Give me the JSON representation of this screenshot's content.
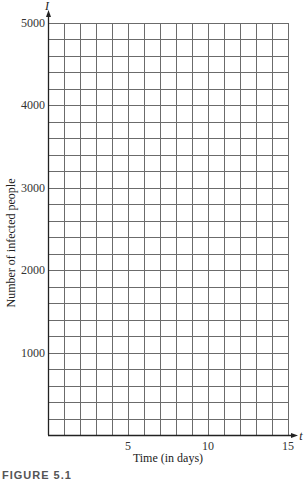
{
  "chart_data": {
    "type": "line",
    "title": "",
    "xlabel": "Time (in days)",
    "ylabel": "Number of infected people",
    "x_axis_variable": "t",
    "y_axis_variable": "I",
    "xlim": [
      0,
      15
    ],
    "ylim": [
      0,
      5000
    ],
    "x_ticks": [
      5,
      10,
      15
    ],
    "x_tick_labels": [
      "5",
      "10",
      "15"
    ],
    "y_ticks": [
      1000,
      2000,
      3000,
      4000,
      5000
    ],
    "y_tick_labels": [
      "1000",
      "2000",
      "3000",
      "4000",
      "5000"
    ],
    "grid": true,
    "grid_x_step": 1,
    "grid_y_step": 200,
    "series": [],
    "note": "Blank grid for plotting; no data series drawn"
  },
  "caption": "FIGURE 5.1",
  "colors": {
    "grid": "#6b6b6b",
    "axis": "#222222",
    "text": "#222222"
  }
}
